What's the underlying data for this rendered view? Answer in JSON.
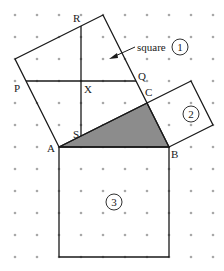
{
  "diagram": {
    "type": "geometry-dot-grid",
    "colors": {
      "line": "#1a1a1a",
      "dot": "#a8a8a8",
      "shade": "#8c8c8c",
      "background": "#ffffff"
    },
    "grid": {
      "cols": 10,
      "rows": 12
    },
    "points": {
      "A": [
        2,
        6
      ],
      "B": [
        7,
        6
      ],
      "C": [
        6,
        4
      ],
      "P": [
        0.5,
        3
      ],
      "Q": [
        5.5,
        3
      ],
      "R": [
        3,
        0.5
      ],
      "S": [
        3,
        5.5
      ],
      "X": [
        3,
        3
      ]
    },
    "squares": [
      {
        "id": "1",
        "label": "1",
        "corners": [
          [
            2,
            6
          ],
          [
            6,
            4
          ],
          [
            4,
            0
          ],
          [
            0,
            2
          ]
        ],
        "number_pos": [
          8.9,
          1.6
        ]
      },
      {
        "id": "2",
        "label": "2",
        "corners": [
          [
            6,
            4
          ],
          [
            7,
            6
          ],
          [
            9,
            5
          ],
          [
            8,
            3
          ]
        ],
        "number_pos": [
          8.0,
          4.5
        ]
      },
      {
        "id": "3",
        "label": "3",
        "corners": [
          [
            2,
            6
          ],
          [
            7,
            6
          ],
          [
            7,
            11
          ],
          [
            2,
            11
          ]
        ],
        "number_pos": [
          4.5,
          8.5
        ]
      }
    ],
    "shaded_triangle": [
      "A",
      "B",
      "C"
    ],
    "segments": [
      [
        "P",
        "Q"
      ],
      [
        "R",
        "S"
      ]
    ],
    "labels": [
      {
        "text": "R",
        "point": "R",
        "dx": -8,
        "dy": -4
      },
      {
        "text": "P",
        "point": "P",
        "dx": -12,
        "dy": 11
      },
      {
        "text": "X",
        "point": "X",
        "dx": 3,
        "dy": 12
      },
      {
        "text": "Q",
        "point": "Q",
        "dx": 2,
        "dy": -1
      },
      {
        "text": "C",
        "point": "C",
        "dx": -2,
        "dy": -7
      },
      {
        "text": "S",
        "point": "S",
        "dx": -8,
        "dy": 2
      },
      {
        "text": "A",
        "point": "A",
        "dx": -12,
        "dy": 5
      },
      {
        "text": "B",
        "point": "B",
        "dx": 2,
        "dy": 11
      }
    ],
    "callout": {
      "text": "square",
      "circled": "1"
    }
  }
}
